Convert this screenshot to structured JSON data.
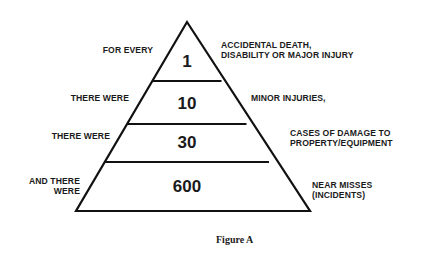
{
  "figure": {
    "caption": "Figure A",
    "type": "pyramid",
    "levels": [
      {
        "left_label": [
          "FOR EVERY"
        ],
        "count": "1",
        "right_label": [
          "ACCIDENTAL DEATH,",
          "DISABILITY OR MAJOR INJURY"
        ]
      },
      {
        "left_label": [
          "THERE WERE"
        ],
        "count": "10",
        "right_label": [
          "MINOR INJURIES,"
        ]
      },
      {
        "left_label": [
          "THERE WERE"
        ],
        "count": "30",
        "right_label": [
          "CASES OF DAMAGE TO",
          "PROPERTY/EQUIPMENT"
        ]
      },
      {
        "left_label": [
          "AND THERE",
          "WERE"
        ],
        "count": "600",
        "right_label": [
          "NEAR MISSES",
          "(INCIDENTS)"
        ]
      }
    ]
  },
  "colors": {
    "line": "#111111",
    "text": "#1a1a1a",
    "background": "#ffffff"
  }
}
